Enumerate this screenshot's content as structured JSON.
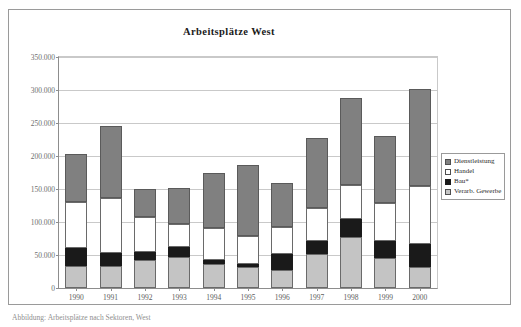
{
  "figure": {
    "title": "Arbeitsplätze West",
    "caption": "Abbildung: Arbeitsplätze nach Sektoren, West"
  },
  "legend": {
    "position": "right",
    "items": [
      {
        "label": "Dienstleistung",
        "color": "#808080",
        "swatch": "dl"
      },
      {
        "label": "Handel",
        "color": "#ffffff",
        "swatch": "han"
      },
      {
        "label": "Bau*",
        "color": "#1a1a1a",
        "swatch": "bau"
      },
      {
        "label": "Verarb. Gewerbe",
        "color": "#c4c4c4",
        "swatch": "vg"
      }
    ]
  },
  "axes": {
    "y_ticks": [
      "350.000",
      "300.000",
      "250.000",
      "200.000",
      "150.000",
      "100.000",
      "50.000",
      "0"
    ],
    "y_tick_values": [
      350000,
      300000,
      250000,
      200000,
      150000,
      100000,
      50000,
      0
    ],
    "x_ticks": [
      "1990",
      "1991",
      "1992",
      "1993",
      "1994",
      "1995",
      "1996",
      "1997",
      "1998",
      "1999",
      "2000"
    ]
  },
  "chart_data": {
    "type": "bar",
    "stacked": true,
    "title": "Arbeitsplätze West",
    "xlabel": "",
    "ylabel": "",
    "ylim": [
      0,
      350000
    ],
    "ytick_step": 50000,
    "grid": true,
    "legend_position": "right",
    "categories": [
      "1990",
      "1991",
      "1992",
      "1993",
      "1994",
      "1995",
      "1996",
      "1997",
      "1998",
      "1999",
      "2000"
    ],
    "series": [
      {
        "name": "Verarb. Gewerbe",
        "color": "#c4c4c4",
        "values": [
          33000,
          33000,
          42000,
          47000,
          36000,
          32000,
          28000,
          52000,
          77000,
          45000,
          32000
        ]
      },
      {
        "name": "Bau*",
        "color": "#1a1a1a",
        "values": [
          27000,
          20000,
          13000,
          15000,
          7000,
          5000,
          24000,
          20000,
          27000,
          26000,
          34000
        ]
      },
      {
        "name": "Handel",
        "color": "#ffffff",
        "values": [
          70000,
          84000,
          53000,
          35000,
          48000,
          42000,
          41000,
          50000,
          52000,
          58000,
          89000
        ]
      },
      {
        "name": "Dienstleistung",
        "color": "#808080",
        "values": [
          73000,
          108000,
          42000,
          55000,
          84000,
          108000,
          66000,
          105000,
          132000,
          102000,
          147000
        ]
      }
    ],
    "totals": [
      203000,
      245000,
      150000,
      152000,
      175000,
      187000,
      159000,
      227000,
      288000,
      231000,
      302000
    ]
  },
  "colors": {
    "dienstleistung": "#808080",
    "handel": "#ffffff",
    "bau": "#1a1a1a",
    "verarb_gewerbe": "#c4c4c4",
    "grid": "#c9c9c9",
    "axis": "#8d8d8d",
    "frame": "#9a9a9a"
  }
}
